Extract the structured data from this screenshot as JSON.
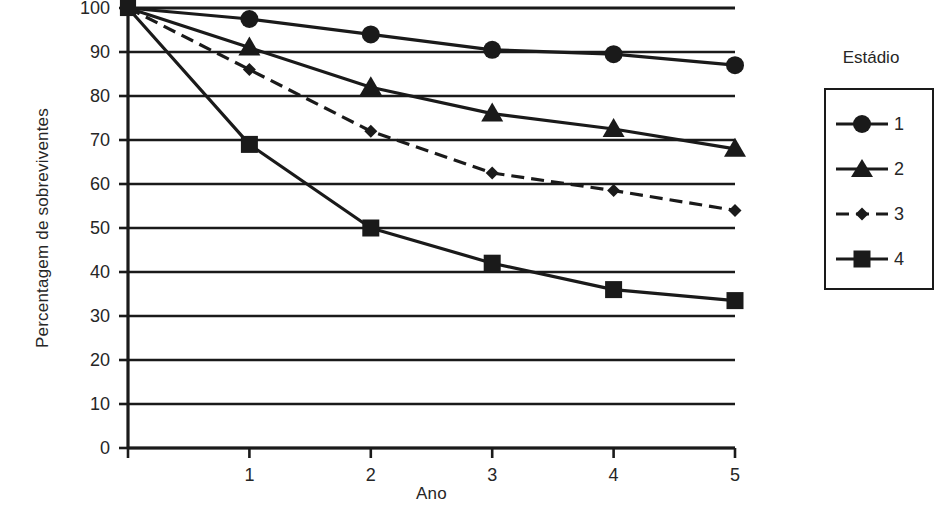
{
  "chart_data": {
    "type": "line",
    "title": "",
    "xlabel": "Ano",
    "ylabel": "Percentagem de sobreviventes",
    "x": [
      0,
      1,
      2,
      3,
      4,
      5
    ],
    "xticklabels": [
      "0",
      "1",
      "2",
      "3",
      "4",
      "5"
    ],
    "yticklabels": [
      "0",
      "10",
      "20",
      "30",
      "40",
      "50",
      "60",
      "70",
      "80",
      "90",
      "100"
    ],
    "xlim": [
      0,
      5
    ],
    "ylim": [
      0,
      100
    ],
    "grid": "horizontal",
    "legend_position": "right-outside",
    "legend_title": "Estádio",
    "series": [
      {
        "name": "1",
        "marker": "circle",
        "linestyle": "solid",
        "color": "#1a1a1a",
        "values": [
          100,
          97.5,
          94,
          90.5,
          89.5,
          87
        ]
      },
      {
        "name": "2",
        "marker": "triangle",
        "linestyle": "solid",
        "color": "#1a1a1a",
        "values": [
          100,
          91,
          82,
          76,
          72.5,
          68
        ]
      },
      {
        "name": "3",
        "marker": "diamond",
        "linestyle": "dashed",
        "color": "#1a1a1a",
        "values": [
          100,
          86,
          72,
          62.5,
          58.5,
          54
        ]
      },
      {
        "name": "4",
        "marker": "square",
        "linestyle": "solid",
        "color": "#1a1a1a",
        "values": [
          100,
          69,
          50,
          42,
          36,
          33.5
        ]
      }
    ]
  }
}
